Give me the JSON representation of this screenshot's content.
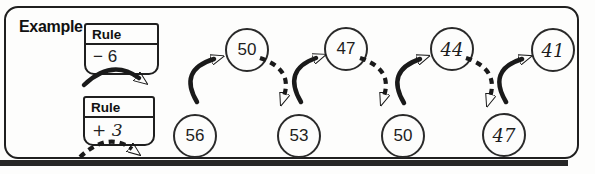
{
  "example_label": "Example",
  "rule_boxes": [
    {
      "label": "Rule",
      "value": "− 6",
      "arrow_style": "solid",
      "handwritten": false
    },
    {
      "label": "Rule",
      "value": "+ 3",
      "arrow_style": "dashed",
      "handwritten": true
    }
  ],
  "sequence": [
    {
      "value": "56",
      "row": "bottom",
      "style": "printed"
    },
    {
      "value": "50",
      "row": "top",
      "style": "printed"
    },
    {
      "value": "53",
      "row": "bottom",
      "style": "printed"
    },
    {
      "value": "47",
      "row": "top",
      "style": "printed"
    },
    {
      "value": "50",
      "row": "bottom",
      "style": "printed"
    },
    {
      "value": "44",
      "row": "top",
      "style": "handwritten"
    },
    {
      "value": "47",
      "row": "bottom",
      "style": "handwritten"
    },
    {
      "value": "41",
      "row": "top",
      "style": "handwritten"
    }
  ],
  "arrow_meaning": {
    "solid_rule": "− 6",
    "dashed_rule": "+ 3"
  },
  "colors": {
    "ink": "#1a1a1a",
    "background": "#fdfdfc"
  }
}
